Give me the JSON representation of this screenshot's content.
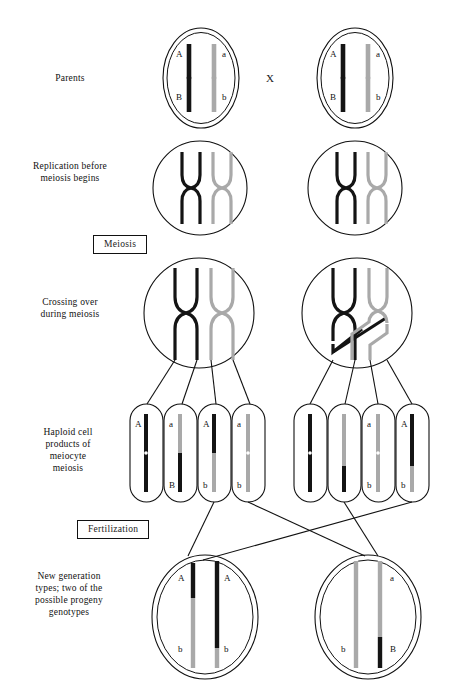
{
  "figure": {
    "colors": {
      "black_chromosome": "#141414",
      "gray_chromosome": "#a9a9a9",
      "outline": "#111111",
      "background": "#ffffff",
      "connector": "#111111"
    }
  },
  "row_labels": [
    {
      "name": "parents",
      "text": "Parents"
    },
    {
      "name": "replication",
      "text": "Replication before\nmeiosis begins"
    },
    {
      "name": "crossing-over",
      "text": "Crossing over\nduring meiosis"
    },
    {
      "name": "haploid-products",
      "text": "Haploid cell\nproducts of\nmeiocyte\nmeiosis"
    },
    {
      "name": "new-generation",
      "text": "New generation\ntypes; two of the\npossible progeny\ngenotypes"
    }
  ],
  "stage_boxes": [
    {
      "name": "meiosis",
      "text": "Meiosis"
    },
    {
      "name": "fertilization",
      "text": "Fertilization"
    }
  ],
  "cross_symbol": "X",
  "parents": [
    {
      "name": "parent-cell-left",
      "chromosomes": [
        {
          "color": "black",
          "top_allele": "A",
          "bottom_allele": "B"
        },
        {
          "color": "gray",
          "top_allele": "a",
          "bottom_allele": "b"
        }
      ]
    },
    {
      "name": "parent-cell-right",
      "chromosomes": [
        {
          "color": "black",
          "top_allele": "A",
          "bottom_allele": "B"
        },
        {
          "color": "gray",
          "top_allele": "a",
          "bottom_allele": "b"
        }
      ]
    }
  ],
  "replication_cells": [
    {
      "name": "replicated-cell-left",
      "pairs": [
        "black",
        "gray"
      ]
    },
    {
      "name": "replicated-cell-right",
      "pairs": [
        "black",
        "gray"
      ]
    }
  ],
  "meiosis_cells": [
    {
      "name": "meiocyte-left",
      "crossover": false,
      "note": "no crossover between the marked loci"
    },
    {
      "name": "meiocyte-right",
      "crossover": true,
      "note": "crossover between black and gray chromatids"
    }
  ],
  "haploid_groups": [
    {
      "name": "haploid-group-left",
      "cells": [
        {
          "name": "gamete-1",
          "top_color": "black",
          "bottom_color": "black",
          "top_allele": "A",
          "bottom_allele": ""
        },
        {
          "name": "gamete-2",
          "top_color": "gray",
          "bottom_color": "black",
          "top_allele": "a",
          "bottom_allele": "B"
        },
        {
          "name": "gamete-3",
          "top_color": "black",
          "bottom_color": "gray",
          "top_allele": "A",
          "bottom_allele": "b"
        },
        {
          "name": "gamete-4",
          "top_color": "gray",
          "bottom_color": "gray",
          "top_allele": "a",
          "bottom_allele": "b"
        }
      ]
    },
    {
      "name": "haploid-group-right",
      "cells": [
        {
          "name": "gamete-5",
          "top_color": "black",
          "bottom_color": "black",
          "top_allele": "",
          "bottom_allele": ""
        },
        {
          "name": "gamete-6",
          "top_color": "gray",
          "bottom_color": "black",
          "top_allele": "",
          "bottom_allele": ""
        },
        {
          "name": "gamete-7",
          "top_color": "gray",
          "bottom_color": "gray",
          "top_allele": "a",
          "bottom_allele": "b"
        },
        {
          "name": "gamete-8",
          "top_color": "black",
          "bottom_color": "gray",
          "top_allele": "A",
          "bottom_allele": "b"
        }
      ]
    }
  ],
  "progeny": [
    {
      "name": "progeny-cell-left",
      "chromosomes": [
        {
          "top_color": "black",
          "bottom_color": "gray",
          "top_allele": "A",
          "bottom_allele": "b"
        },
        {
          "top_color": "black",
          "bottom_color": "black",
          "top_allele": "A",
          "bottom_allele": "b"
        }
      ]
    },
    {
      "name": "progeny-cell-right",
      "chromosomes": [
        {
          "top_color": "gray",
          "bottom_color": "gray",
          "top_allele": "",
          "bottom_allele": "b"
        },
        {
          "top_color": "gray",
          "bottom_color": "black",
          "top_allele": "a",
          "bottom_allele": "B"
        }
      ]
    }
  ]
}
